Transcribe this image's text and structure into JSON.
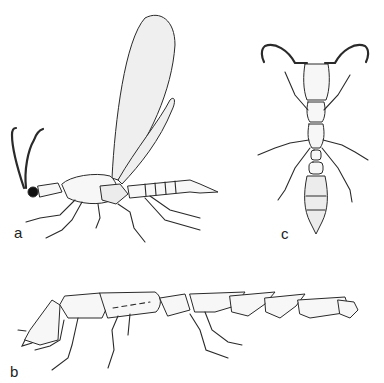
{
  "figure": {
    "panels": [
      {
        "id": "a",
        "label": "a",
        "subject": "winged insect, lateral view"
      },
      {
        "id": "b",
        "label": "b",
        "subject": "elongate wingless insect, lateral view"
      },
      {
        "id": "c",
        "label": "c",
        "subject": "ant-like insect, dorsal view"
      }
    ],
    "colors": {
      "ink": "#2a2a2a",
      "background": "#ffffff"
    }
  }
}
